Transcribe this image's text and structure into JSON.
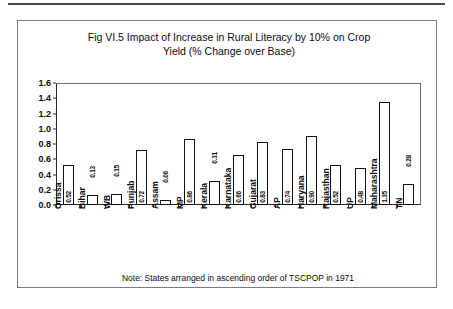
{
  "figure": {
    "title": "Fig VI.5 Impact of Increase in Rural Literacy by 10% on Crop Yield (% Change over Base)",
    "title_line1": "Fig VI.5 Impact of Increase in Rural Literacy by 10% on Crop",
    "title_line2": "Yield (% Change over Base)",
    "footnote": "Note: States arranged in ascending order of TSCPOP in 1971"
  },
  "chart_data": {
    "type": "bar",
    "title": "Fig VI.5 Impact of Increase in Rural Literacy by 10% on Crop Yield (% Change over Base)",
    "xlabel": "",
    "ylabel": "",
    "ylim": [
      0.0,
      1.6
    ],
    "ytick_labels": [
      "0.0",
      "0.2",
      "0.4",
      "0.6",
      "0.8",
      "1.0",
      "1.2",
      "1.4",
      "1.6"
    ],
    "ytick_values": [
      0.0,
      0.2,
      0.4,
      0.6,
      0.8,
      1.0,
      1.2,
      1.4,
      1.6
    ],
    "grid": false,
    "legend": null,
    "bar_style": {
      "fill": "#ffffff",
      "edge": "#111111"
    },
    "annotation": "Note: States arranged in ascending order of TSCPOP in 1971",
    "categories": [
      "Orissa",
      "Bihar",
      "WB",
      "Punjab",
      "Assam",
      "MP",
      "Kerala",
      "Karnataka",
      "Gujarat",
      "AP",
      "Haryana",
      "Rajasthan",
      "UP",
      "Maharashtra",
      "TN"
    ],
    "values": [
      0.52,
      0.13,
      0.15,
      0.72,
      0.06,
      0.86,
      0.31,
      0.66,
      0.83,
      0.74,
      0.9,
      0.52,
      0.48,
      1.35,
      0.28
    ],
    "value_labels": [
      "0.52",
      "0.13",
      "0.15",
      "0.72",
      "0.06",
      "0.86",
      "0.31",
      "0.66",
      "0.83",
      "0.74",
      "0.90",
      "0.52",
      "0.48",
      "1.35",
      "0.28"
    ]
  }
}
